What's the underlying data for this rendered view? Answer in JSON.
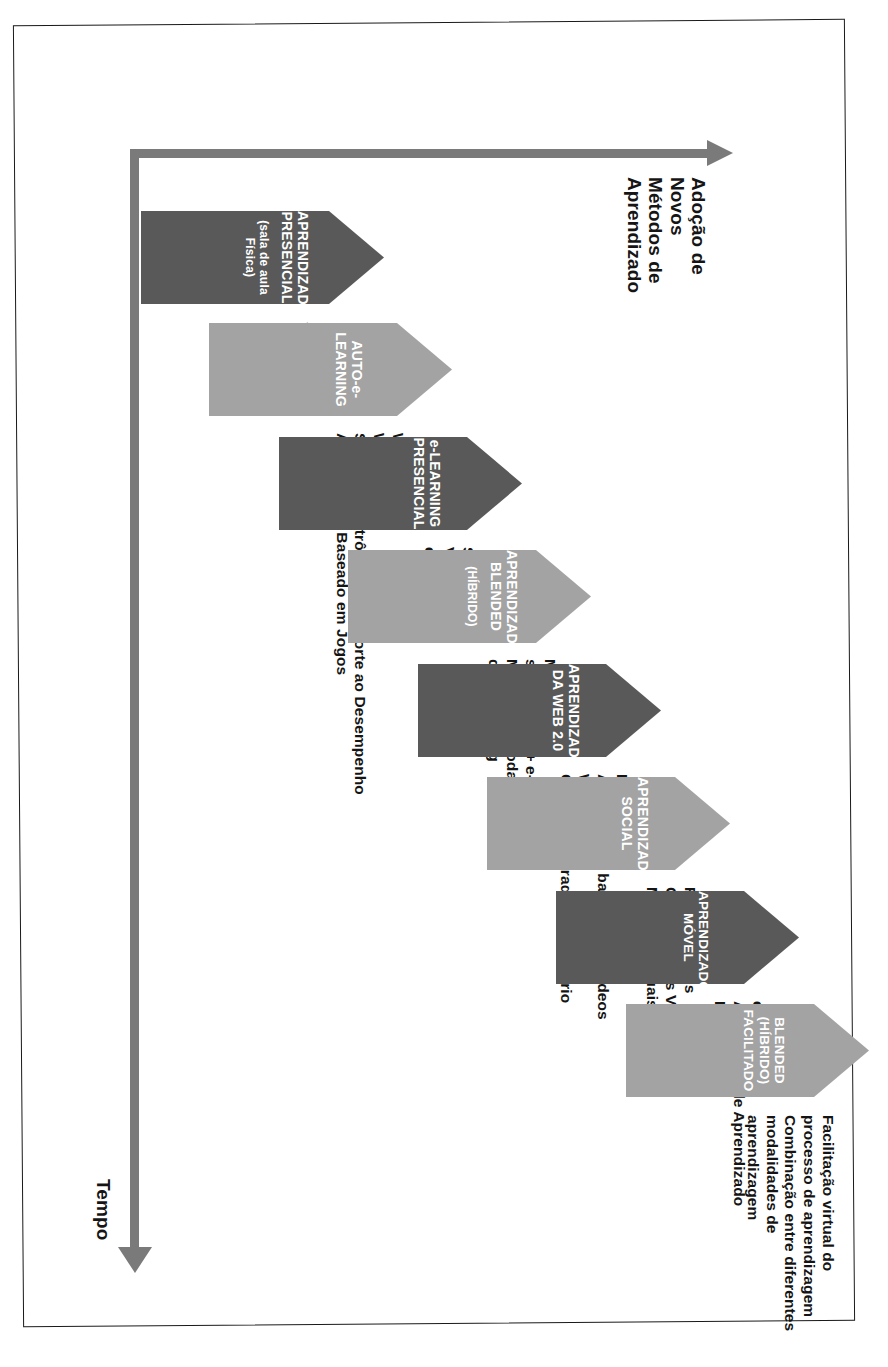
{
  "diagram": {
    "colors": {
      "light_arrow": "#a3a3a3",
      "dark_arrow": "#595959",
      "axis": "#7a7a7a",
      "text_dark": "#141414",
      "text_on_arrow": "#ffffff",
      "frame": "#1a1a1a",
      "background": "#ffffff"
    }
  },
  "axes": {
    "x_axis": {
      "label": "Tempo",
      "direction": "increasing",
      "arrow_icon": "arrow-right-icon"
    },
    "y_axis": {
      "label": "Adoção de\nNovos\nMétodos de\nAprendizado",
      "direction": "increasing",
      "arrow_icon": "arrow-up-icon"
    }
  },
  "stages": [
    {
      "id": "aprendizado-presencial",
      "shade": "dark",
      "title": "APRENDIZADO\nPRESENCIAL",
      "subtitle": "(sala de aula Física)",
      "description": "Simulação\nFacilitada\npor Aulas"
    },
    {
      "id": "auto-e-learning",
      "shade": "light",
      "title": "AUTO-e-LEARNING",
      "subtitle": "",
      "description": "WBT\nWebinars\nSistema eEletrônico de Suporte ao Desempenho\nAprendizado Baseado em Jogos"
    },
    {
      "id": "e-learning-presencial",
      "shade": "dark",
      "title": "e-LEARNING\nPRESENCIAL",
      "subtitle": "",
      "description": "Sala de Aula\nVirtual\ne-Coaching"
    },
    {
      "id": "aprendizado-blended-hibrido",
      "shade": "light",
      "title": "APRENDIZADO\nBLENDED",
      "subtitle": "(HÍBRIDO)",
      "description": "Mescla de\nsala de aula + e-Learning\nMescla de modalidade\nde e-Learning"
    },
    {
      "id": "aprendizado-da-web-2-0",
      "shade": "dark",
      "title": "APRENDIZADO\nDA WEB 2.0",
      "subtitle": "",
      "description": "Podcasts\nAprendizado baseado em Vídeos\nWiki´s\nConteúdo gerado pelo Usuário"
    },
    {
      "id": "aprendizado-social",
      "shade": "light",
      "title": "APRENDIZADO\nSOCIAL",
      "subtitle": "",
      "description": "Redes Sociais\nComunidades Virtuais\nMundos Virtuais"
    },
    {
      "id": "aprendizado-movel",
      "shade": "dark",
      "title": "APRENDIZADO MÓVEL",
      "subtitle": "",
      "description": "e-Books\nAplicativos de Aprendizado\nMicroblogs"
    },
    {
      "id": "blended-hibrido-facilitado",
      "shade": "light",
      "title": "BLENDED (HÍBRIDO)\nFACILITADO",
      "subtitle": "",
      "description": "Facilitação virtual do\nprocesso de aprendizagem\nCombinação entre diferentes\nmodalidades de aprendizagem"
    }
  ]
}
